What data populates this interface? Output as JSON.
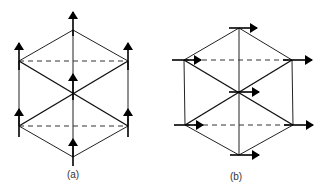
{
  "figure": {
    "panels": [
      {
        "id": "a",
        "label": "(a)",
        "arrow_direction": "up",
        "arrow_count": 7
      },
      {
        "id": "b",
        "label": "(b)",
        "arrow_direction": "right",
        "arrow_count": 7
      }
    ],
    "colors": {
      "line": "#222222",
      "arrow": "#000000",
      "background": "#ffffff"
    }
  }
}
